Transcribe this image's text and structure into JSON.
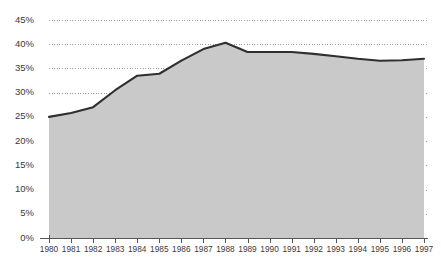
{
  "chart_data": {
    "type": "area",
    "title": "",
    "subtitle": "",
    "xlabel": "",
    "ylabel": "",
    "categories": [
      "1980",
      "1981",
      "1982",
      "1983",
      "1984",
      "1985",
      "1986",
      "1987",
      "1988",
      "1989",
      "1990",
      "1991",
      "1992",
      "1993",
      "1994",
      "1995",
      "1996",
      "1997"
    ],
    "values": [
      25.0,
      25.8,
      27.0,
      30.5,
      33.5,
      33.9,
      36.6,
      39.0,
      40.3,
      38.4,
      38.4,
      38.4,
      38.0,
      37.5,
      37.0,
      36.6,
      36.7,
      37.0
    ],
    "series": [
      {
        "name": "series-1",
        "values": [
          25.0,
          25.8,
          27.0,
          30.5,
          33.5,
          33.9,
          36.6,
          39.0,
          40.3,
          38.4,
          38.4,
          38.4,
          38.0,
          37.5,
          37.0,
          36.6,
          36.7,
          37.0
        ]
      }
    ],
    "ylim": [
      0,
      45
    ],
    "xlim": [
      "1980",
      "1997"
    ],
    "y_ticks": [
      0,
      5,
      10,
      15,
      20,
      25,
      30,
      35,
      40,
      45
    ],
    "y_tick_labels": [
      "0%",
      "5%",
      "10%",
      "15%",
      "20%",
      "25%",
      "30%",
      "35%",
      "40%",
      "45%"
    ],
    "x_tick_labels": [
      "1980",
      "1981",
      "1982",
      "1983",
      "1984",
      "1985",
      "1986",
      "1987",
      "1988",
      "1989",
      "1990",
      "1991",
      "1992",
      "1993",
      "1994",
      "1995",
      "1996",
      "1997"
    ],
    "grid": true,
    "grid_style": "dotted-horizontal",
    "legend": false,
    "legend_position": "none",
    "value_suffix": "%",
    "colors": {
      "background": "#ffffff",
      "area_fill": "#c9c9c9",
      "line": "#2f2f2f",
      "gridline": "#9a9a9a",
      "axis": "#555555",
      "tick_text": "#3a3a3a"
    }
  }
}
